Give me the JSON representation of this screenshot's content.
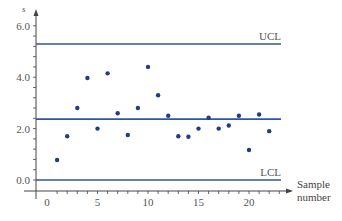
{
  "chart_data": {
    "type": "scatter",
    "title": "",
    "xlabel": "Sample number",
    "ylabel": "s",
    "x": [
      1,
      2,
      3,
      4,
      5,
      6,
      7,
      8,
      9,
      10,
      11,
      12,
      13,
      14,
      15,
      16,
      17,
      18,
      19,
      20,
      21,
      22
    ],
    "series": [
      {
        "name": "s",
        "values": [
          0.78,
          1.7,
          2.8,
          3.97,
          2.0,
          4.15,
          2.6,
          1.75,
          2.8,
          4.4,
          3.3,
          2.5,
          1.7,
          1.68,
          2.0,
          2.42,
          2.0,
          2.12,
          2.5,
          1.17,
          2.55,
          1.9
        ]
      }
    ],
    "control_lines": [
      {
        "name": "UCL",
        "label": "UCL",
        "value": 5.29
      },
      {
        "name": "CL",
        "label": "",
        "value": 2.37
      },
      {
        "name": "LCL",
        "label": "LCL",
        "value": 0.0
      }
    ],
    "xticks": [
      0,
      5,
      10,
      15,
      20
    ],
    "xtick_labels": [
      "0",
      "5",
      "10",
      "15",
      "20"
    ],
    "yticks": [
      0.0,
      2.0,
      4.0,
      6.0
    ],
    "ytick_labels": [
      "0.0",
      "2.0",
      "4.0",
      "6.0"
    ],
    "xlim": [
      -1,
      23
    ],
    "ylim": [
      -0.4,
      6.5
    ],
    "grid": false,
    "legend": "none"
  },
  "colors": {
    "line": "#2e55a6",
    "point": "#1f3c8c",
    "axis": "#444444"
  },
  "labels": {
    "ucl": "UCL",
    "lcl": "LCL",
    "x_title_line1": "Sample",
    "x_title_line2": "number",
    "y_title": "s"
  }
}
